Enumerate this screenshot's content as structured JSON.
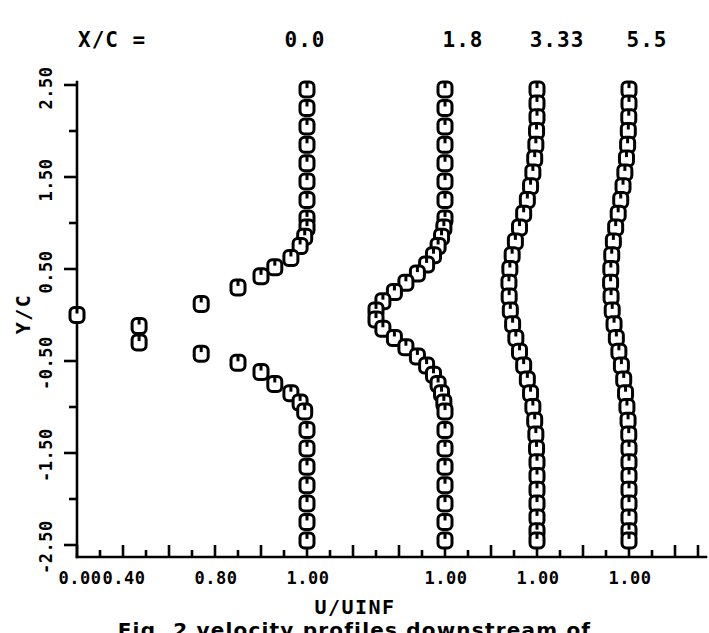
{
  "header": {
    "station_prefix": "X/C =",
    "stations": [
      "0.0",
      "1.8",
      "3.33",
      "5.5"
    ]
  },
  "axes": {
    "xlabel": "U/UINF",
    "ylabel": "Y/C",
    "x_tick_labels": [
      "0.00",
      "0.40",
      "0.80",
      "1.00",
      "1.00",
      "1.00",
      "1.00"
    ],
    "y_tick_labels": [
      "2.50",
      "1.50",
      "0.50",
      "-0.50",
      "-1.50",
      "-2.50"
    ]
  },
  "caption": "Fig. 2    velocity profiles downstream of",
  "colors": {
    "ink": "#000000",
    "background": "#ffffff"
  },
  "chart_data": {
    "type": "line",
    "title": "",
    "xlabel": "U/UINF",
    "ylabel": "Y/C",
    "grid": false,
    "legend": "top",
    "xlim": [
      0.0,
      1.1
    ],
    "ylim": [
      -2.5,
      2.5
    ],
    "x_ticks": [
      0.0,
      0.2,
      0.4,
      0.6,
      0.8,
      1.0
    ],
    "x_tick_labels": [
      "0.00",
      "",
      "0.40",
      "",
      "0.80",
      "1.00"
    ],
    "y_ticks": [
      -2.5,
      -2.0,
      -1.5,
      -1.0,
      -0.5,
      0.0,
      0.5,
      1.0,
      1.5,
      2.0,
      2.5
    ],
    "y_tick_labels": [
      "-2.50",
      "",
      "-1.50",
      "",
      "-0.50",
      "",
      "0.50",
      "",
      "1.50",
      "",
      "2.50"
    ],
    "note": "Four streamwise stations; each profile plotted against its own offset U/UINF axis normalized to 1.00 at the freestream.",
    "series": [
      {
        "name": "X/C = 0.0",
        "station": 0.0,
        "marker": "square-u",
        "y": [
          2.45,
          2.25,
          2.05,
          1.85,
          1.65,
          1.45,
          1.25,
          1.05,
          0.95,
          0.85,
          0.75,
          0.62,
          0.52,
          0.42,
          0.3,
          0.12,
          0.0,
          -0.12,
          -0.3,
          -0.42,
          -0.52,
          -0.62,
          -0.75,
          -0.85,
          -0.95,
          -1.05,
          -1.25,
          -1.45,
          -1.65,
          -1.85,
          -2.05,
          -2.25,
          -2.45
        ],
        "u": [
          1.0,
          1.0,
          1.0,
          1.0,
          1.0,
          1.0,
          1.0,
          1.0,
          1.0,
          0.99,
          0.97,
          0.93,
          0.86,
          0.8,
          0.7,
          0.54,
          0.0,
          0.27,
          0.27,
          0.54,
          0.7,
          0.8,
          0.86,
          0.93,
          0.97,
          0.99,
          1.0,
          1.0,
          1.0,
          1.0,
          1.0,
          1.0,
          1.0
        ]
      },
      {
        "name": "X/C = 1.8",
        "station": 1.8,
        "marker": "square-u",
        "y": [
          2.45,
          2.25,
          2.05,
          1.85,
          1.65,
          1.45,
          1.25,
          1.05,
          0.95,
          0.85,
          0.75,
          0.65,
          0.55,
          0.45,
          0.35,
          0.25,
          0.15,
          0.05,
          -0.05,
          -0.15,
          -0.25,
          -0.35,
          -0.45,
          -0.55,
          -0.65,
          -0.75,
          -0.85,
          -0.95,
          -1.05,
          -1.25,
          -1.45,
          -1.65,
          -1.85,
          -2.05,
          -2.25,
          -2.45
        ],
        "u": [
          1.0,
          1.0,
          1.0,
          1.0,
          1.0,
          1.0,
          1.0,
          1.0,
          0.995,
          0.985,
          0.97,
          0.95,
          0.92,
          0.88,
          0.83,
          0.78,
          0.73,
          0.7,
          0.7,
          0.73,
          0.78,
          0.83,
          0.88,
          0.92,
          0.95,
          0.97,
          0.985,
          0.995,
          1.0,
          1.0,
          1.0,
          1.0,
          1.0,
          1.0,
          1.0,
          1.0
        ]
      },
      {
        "name": "X/C = 3.33",
        "station": 3.33,
        "marker": "square-u",
        "y": [
          2.45,
          2.3,
          2.15,
          2.0,
          1.85,
          1.7,
          1.55,
          1.4,
          1.25,
          1.1,
          0.95,
          0.8,
          0.65,
          0.5,
          0.35,
          0.2,
          0.05,
          -0.1,
          -0.25,
          -0.4,
          -0.55,
          -0.7,
          -0.85,
          -1.0,
          -1.15,
          -1.3,
          -1.45,
          -1.6,
          -1.75,
          -1.9,
          -2.05,
          -2.2,
          -2.35,
          -2.45
        ],
        "u": [
          1.0,
          1.0,
          1.0,
          0.998,
          0.995,
          0.99,
          0.982,
          0.972,
          0.958,
          0.942,
          0.924,
          0.906,
          0.892,
          0.882,
          0.878,
          0.879,
          0.884,
          0.894,
          0.908,
          0.924,
          0.942,
          0.958,
          0.972,
          0.982,
          0.99,
          0.995,
          0.998,
          1.0,
          1.0,
          1.0,
          1.0,
          1.0,
          1.0,
          1.0
        ]
      },
      {
        "name": "X/C = 5.5",
        "station": 5.5,
        "marker": "square-u",
        "y": [
          2.45,
          2.3,
          2.15,
          2.0,
          1.85,
          1.7,
          1.55,
          1.4,
          1.25,
          1.1,
          0.95,
          0.8,
          0.65,
          0.5,
          0.35,
          0.2,
          0.05,
          -0.1,
          -0.25,
          -0.4,
          -0.55,
          -0.7,
          -0.85,
          -1.0,
          -1.15,
          -1.3,
          -1.45,
          -1.6,
          -1.75,
          -1.9,
          -2.05,
          -2.2,
          -2.35,
          -2.45
        ],
        "u": [
          1.0,
          1.0,
          0.999,
          0.997,
          0.994,
          0.989,
          0.982,
          0.974,
          0.964,
          0.953,
          0.942,
          0.932,
          0.925,
          0.921,
          0.92,
          0.922,
          0.927,
          0.935,
          0.945,
          0.956,
          0.967,
          0.977,
          0.985,
          0.991,
          0.996,
          0.999,
          1.0,
          1.0,
          1.0,
          1.0,
          1.0,
          1.0,
          1.0,
          1.0
        ]
      }
    ]
  }
}
